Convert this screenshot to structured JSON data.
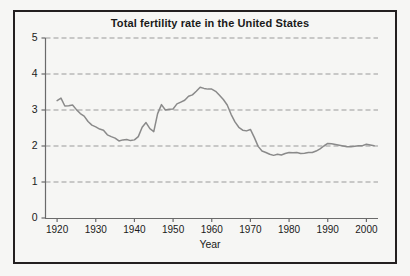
{
  "figure": {
    "background_color": "#f6f6f4",
    "frame_color": "#231f20"
  },
  "chart_data": {
    "type": "line",
    "title": "Total fertility rate in the United States",
    "xlabel": "Year",
    "ylabel": "",
    "xlim": [
      1917,
      2003
    ],
    "ylim": [
      0,
      5
    ],
    "grid": true,
    "grid_axis": "y",
    "grid_style": "dashed",
    "grid_color": "#9a9a9a",
    "line_color": "#8a8a8a",
    "legend": null,
    "x_ticks": [
      1920,
      1930,
      1940,
      1950,
      1960,
      1970,
      1980,
      1990,
      2000
    ],
    "x_tick_labels": [
      "1920",
      "1930",
      "1940",
      "1950",
      "1960",
      "1970",
      "1980",
      "1990",
      "2000"
    ],
    "y_ticks": [
      0,
      1,
      2,
      3,
      4,
      5
    ],
    "y_tick_labels": [
      "0",
      "1",
      "2",
      "3",
      "4",
      "5"
    ],
    "series": [
      {
        "name": "Total fertility rate",
        "x": [
          1920,
          1921,
          1922,
          1923,
          1924,
          1925,
          1926,
          1927,
          1928,
          1929,
          1930,
          1931,
          1932,
          1933,
          1934,
          1935,
          1936,
          1937,
          1938,
          1939,
          1940,
          1941,
          1942,
          1943,
          1944,
          1945,
          1946,
          1947,
          1948,
          1949,
          1950,
          1951,
          1952,
          1953,
          1954,
          1955,
          1956,
          1957,
          1958,
          1959,
          1960,
          1961,
          1962,
          1963,
          1964,
          1965,
          1966,
          1967,
          1968,
          1969,
          1970,
          1971,
          1972,
          1973,
          1974,
          1975,
          1976,
          1977,
          1978,
          1979,
          1980,
          1981,
          1982,
          1983,
          1984,
          1985,
          1986,
          1987,
          1988,
          1989,
          1990,
          1991,
          1992,
          1993,
          1994,
          1995,
          1996,
          1997,
          1998,
          1999,
          2000,
          2001,
          2002
        ],
        "values": [
          3.26,
          3.33,
          3.11,
          3.12,
          3.14,
          3.01,
          2.9,
          2.83,
          2.68,
          2.58,
          2.53,
          2.47,
          2.44,
          2.31,
          2.26,
          2.22,
          2.14,
          2.17,
          2.18,
          2.15,
          2.17,
          2.26,
          2.52,
          2.65,
          2.48,
          2.4,
          2.9,
          3.15,
          3.0,
          3.02,
          3.03,
          3.17,
          3.22,
          3.27,
          3.38,
          3.42,
          3.52,
          3.63,
          3.6,
          3.58,
          3.58,
          3.52,
          3.41,
          3.29,
          3.14,
          2.88,
          2.67,
          2.52,
          2.44,
          2.42,
          2.46,
          2.24,
          1.99,
          1.86,
          1.82,
          1.77,
          1.74,
          1.77,
          1.75,
          1.79,
          1.82,
          1.81,
          1.82,
          1.79,
          1.8,
          1.82,
          1.82,
          1.86,
          1.92,
          2.0,
          2.07,
          2.06,
          2.04,
          2.02,
          2.0,
          1.98,
          1.98,
          1.99,
          2.01,
          2.01,
          2.05,
          2.03,
          2.01
        ]
      }
    ]
  }
}
